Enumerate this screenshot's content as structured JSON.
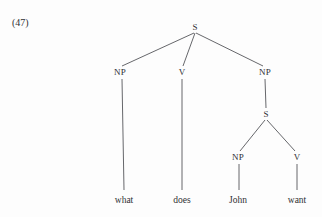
{
  "figure": {
    "example_number": "(47)",
    "caption": "",
    "background_color": "#fdfdfd",
    "line_color": "#55565a",
    "text_color": "#2f3033"
  },
  "tree": {
    "type": "syntax-tree",
    "sentence": "what does John want",
    "nodes": [
      {
        "id": "S-root",
        "label": "S",
        "x": 195,
        "y": 27,
        "kind": "nonterminal"
      },
      {
        "id": "NP-1",
        "label": "NP",
        "x": 120,
        "y": 72,
        "kind": "nonterminal"
      },
      {
        "id": "V-1",
        "label": "V",
        "x": 182,
        "y": 72,
        "kind": "nonterminal"
      },
      {
        "id": "NP-2",
        "label": "NP",
        "x": 265,
        "y": 72,
        "kind": "nonterminal"
      },
      {
        "id": "S-emb",
        "label": "S",
        "x": 266,
        "y": 114,
        "kind": "nonterminal"
      },
      {
        "id": "NP-3",
        "label": "NP",
        "x": 238,
        "y": 157,
        "kind": "nonterminal"
      },
      {
        "id": "V-2",
        "label": "V",
        "x": 297,
        "y": 157,
        "kind": "nonterminal"
      }
    ],
    "leaves": [
      {
        "id": "leaf-what",
        "label": "what",
        "x": 124,
        "y": 196,
        "parent": "NP-1"
      },
      {
        "id": "leaf-does",
        "label": "does",
        "x": 182,
        "y": 196,
        "parent": "V-1"
      },
      {
        "id": "leaf-john",
        "label": "John",
        "x": 238,
        "y": 196,
        "parent": "NP-3"
      },
      {
        "id": "leaf-want",
        "label": "want",
        "x": 297,
        "y": 196,
        "parent": "V-2"
      }
    ],
    "edges": [
      {
        "from": "S-root",
        "to": "NP-1",
        "x1": 194,
        "y1": 33,
        "x2": 122,
        "y2": 66
      },
      {
        "from": "S-root",
        "to": "V-1",
        "x1": 195,
        "y1": 33,
        "x2": 183,
        "y2": 66
      },
      {
        "from": "S-root",
        "to": "NP-2",
        "x1": 196,
        "y1": 33,
        "x2": 263,
        "y2": 66
      },
      {
        "from": "NP-1",
        "to": "leaf-what",
        "x1": 122,
        "y1": 79,
        "x2": 124,
        "y2": 190
      },
      {
        "from": "V-1",
        "to": "leaf-does",
        "x1": 182,
        "y1": 79,
        "x2": 182,
        "y2": 190
      },
      {
        "from": "NP-2",
        "to": "S-emb",
        "x1": 265,
        "y1": 79,
        "x2": 266,
        "y2": 108
      },
      {
        "from": "S-emb",
        "to": "NP-3",
        "x1": 265,
        "y1": 120,
        "x2": 240,
        "y2": 151
      },
      {
        "from": "S-emb",
        "to": "V-2",
        "x1": 267,
        "y1": 120,
        "x2": 295,
        "y2": 151
      },
      {
        "from": "NP-3",
        "to": "leaf-john",
        "x1": 239,
        "y1": 164,
        "x2": 239,
        "y2": 190
      },
      {
        "from": "V-2",
        "to": "leaf-want",
        "x1": 297,
        "y1": 164,
        "x2": 297,
        "y2": 190
      }
    ]
  }
}
